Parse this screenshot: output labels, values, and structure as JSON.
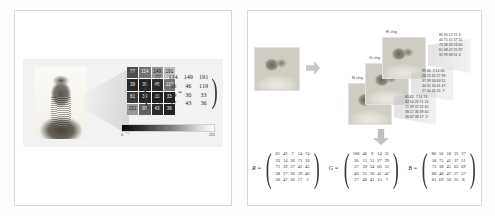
{
  "left_panel": {
    "portrait_caption": "",
    "equals_symbol": "=",
    "pixel_grid": {
      "values": [
        [
          77,
          114,
          149,
          191
        ],
        [
          39,
          36,
          46,
          119
        ],
        [
          61,
          39,
          30,
          33
        ],
        [
          151,
          97,
          43,
          36
        ]
      ]
    },
    "matrix": {
      "rows": [
        [
          "77",
          "114",
          "149",
          "191"
        ],
        [
          "39",
          "36",
          "46",
          "119"
        ],
        [
          "61",
          "39",
          "30",
          "33"
        ],
        [
          "151",
          "97",
          "43",
          "36"
        ]
      ]
    },
    "colorbar": {
      "min_label": "0",
      "max_label": "255",
      "low_color": "#050505",
      "high_color": "#ffffff"
    }
  },
  "right_panel": {
    "channels": [
      {
        "id": "r",
        "label": "R chg"
      },
      {
        "id": "g",
        "label": "G chg"
      },
      {
        "id": "b",
        "label": "B chg"
      }
    ],
    "channel_number_grids": {
      "r": "86 30 12 71 3\n40 75 41 37 51\n73 38 45 53 60\n61 48 47 25 97\n31 99 68 31 3",
      "g": "99 46  9 14 35\n26 15 31 27 39\n37 39 34 60 51\n40 31 30 41 47\n27 40 41 15  7",
      "b": "81 42  7 14 74\n33 14 26 71 16\n71 39 37 42 45\n38 17 36 39 40\n36 47 36 17  3"
    },
    "matrices": [
      {
        "name": "R =",
        "rows": [
          [
            "81",
            "42",
            "7",
            "14",
            "74"
          ],
          [
            "33",
            "14",
            "26",
            "71",
            "16"
          ],
          [
            "71",
            "39",
            "37",
            "42",
            "45"
          ],
          [
            "38",
            "17",
            "36",
            "39",
            "40"
          ],
          [
            "36",
            "47",
            "36",
            "17",
            "3"
          ]
        ]
      },
      {
        "name": "G =",
        "rows": [
          [
            "100",
            "46",
            "9",
            "14",
            "35"
          ],
          [
            "26",
            "15",
            "31",
            "27",
            "39"
          ],
          [
            "37",
            "39",
            "34",
            "60",
            "51"
          ],
          [
            "40",
            "31",
            "30",
            "41",
            "47"
          ],
          [
            "27",
            "40",
            "41",
            "15",
            "7"
          ]
        ]
      },
      {
        "name": "B =",
        "rows": [
          [
            "86",
            "56",
            "18",
            "33",
            "37"
          ],
          [
            "58",
            "75",
            "41",
            "37",
            "51"
          ],
          [
            "73",
            "38",
            "45",
            "63",
            "69"
          ],
          [
            "68",
            "48",
            "47",
            "57",
            "37"
          ],
          [
            "61",
            "69",
            "50",
            "35",
            "8"
          ]
        ]
      }
    ],
    "arrow_right": "arrow-right-icon",
    "arrow_down": "arrow-down-icon"
  }
}
